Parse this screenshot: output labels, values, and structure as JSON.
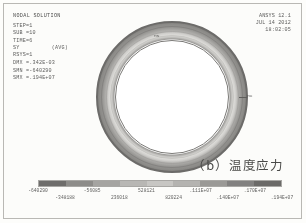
{
  "info_block": {
    "title": "NODAL SOLUTION",
    "lines": [
      "STEP=1",
      "SUB =10",
      "TIME=6",
      "SY          (AVG)",
      "RSYS=1",
      "DMX =.342E-03",
      "SMN =-640290",
      "SMX =.194E+07"
    ]
  },
  "ansys_header": {
    "version": "ANSYS 12.1",
    "date": "JUL 14 2012",
    "time": "18:02:05"
  },
  "plot": {
    "mx_label": "MX",
    "mn_label": "MN"
  },
  "caption": "（b）温度应力",
  "chart_data": {
    "type": "heatmap",
    "title": "NODAL SOLUTION",
    "subtitle": "SY (AVG)",
    "xlabel": "",
    "ylabel": "",
    "legend_position": "bottom",
    "grid": false,
    "geometry": "annulus",
    "units": "Pa",
    "min_value": -640290,
    "max_value": 1940000,
    "dmx": 0.000342,
    "smn": -640290,
    "smx": 1940000,
    "colorbar": {
      "orientation": "horizontal",
      "n_bands": 9,
      "band_colors": [
        "#6e6d6b",
        "#8d8c89",
        "#a5a4a1",
        "#b8b7b4",
        "#c7c6c3",
        "#b4b3b0",
        "#9a9996",
        "#828180",
        "#6b6a68"
      ],
      "tick_labels": [
        "-640290",
        "-348188",
        "-56085",
        "236018",
        "528121",
        "820224",
        ".111E+07",
        ".140E+07",
        ".170E+07",
        ".194E+07"
      ],
      "tick_values": [
        -640290,
        -348188,
        -56085,
        236018,
        528121,
        820224,
        1110000,
        1400000,
        1700000,
        1940000
      ]
    }
  }
}
